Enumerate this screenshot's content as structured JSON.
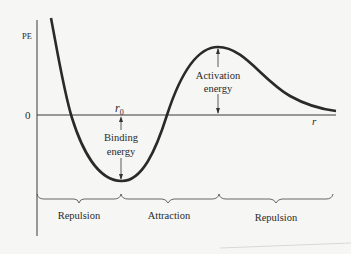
{
  "diagram": {
    "y_axis_label": "PE",
    "x_axis_label": "r",
    "zero_label": "0",
    "r0_label": "r",
    "r0_subscript": "0",
    "binding_energy": [
      "Binding",
      "energy"
    ],
    "activation_energy": [
      "Activation",
      "energy"
    ],
    "regions": [
      {
        "label": "Repulsion"
      },
      {
        "label": "Attraction"
      },
      {
        "label": "Repulsion"
      }
    ],
    "colors": {
      "curve": "#2a2a2a",
      "axis": "#3a3a3a",
      "background": "#f6f6f4"
    }
  }
}
